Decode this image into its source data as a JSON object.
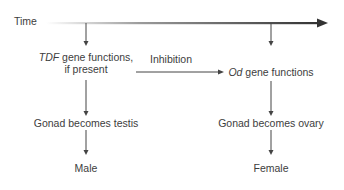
{
  "diagram": {
    "timeline": {
      "label": "Time"
    },
    "left_column": {
      "step1_italic": "TDF",
      "step1_rest": " gene functions,",
      "step1_line2": "if present",
      "step2": "Gonad becomes testis",
      "outcome": "Male"
    },
    "inhibition": {
      "label": "Inhibition"
    },
    "right_column": {
      "step1_italic": "Od",
      "step1_rest": " gene functions",
      "step2": "Gonad becomes ovary",
      "outcome": "Female"
    },
    "colors": {
      "text": "#3d3d3d",
      "arrow_dark": "#333333",
      "arrow_light": "#ffffff"
    }
  }
}
